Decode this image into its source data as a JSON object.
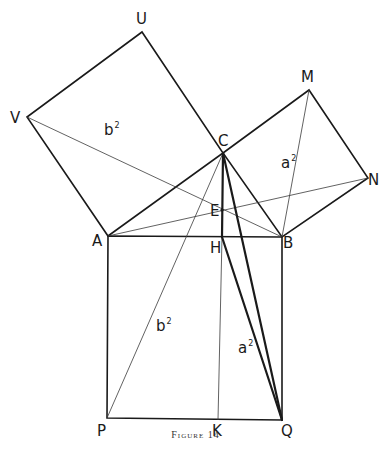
{
  "figure": {
    "caption": "Figure 14",
    "points": {
      "U": {
        "label": "U",
        "x": 142,
        "y": 32
      },
      "V": {
        "label": "V",
        "x": 27,
        "y": 117
      },
      "C": {
        "label": "C",
        "x": 223,
        "y": 153
      },
      "M": {
        "label": "M",
        "x": 309,
        "y": 90
      },
      "N": {
        "label": "N",
        "x": 368,
        "y": 178
      },
      "A": {
        "label": "A",
        "x": 108,
        "y": 236
      },
      "B": {
        "label": "B",
        "x": 282,
        "y": 237
      },
      "E": {
        "label": "E",
        "x": 222,
        "y": 210
      },
      "H": {
        "label": "H",
        "x": 222,
        "y": 237
      },
      "P": {
        "label": "P",
        "x": 107,
        "y": 418
      },
      "K": {
        "label": "K",
        "x": 218,
        "y": 420
      },
      "Q": {
        "label": "Q",
        "x": 282,
        "y": 420
      }
    },
    "area_labels": {
      "b2_upper": {
        "base": "b",
        "exp": "2"
      },
      "a2_upper": {
        "base": "a",
        "exp": "2"
      },
      "b2_lower": {
        "base": "b",
        "exp": "2"
      },
      "a2_lower": {
        "base": "a",
        "exp": "2"
      }
    }
  }
}
